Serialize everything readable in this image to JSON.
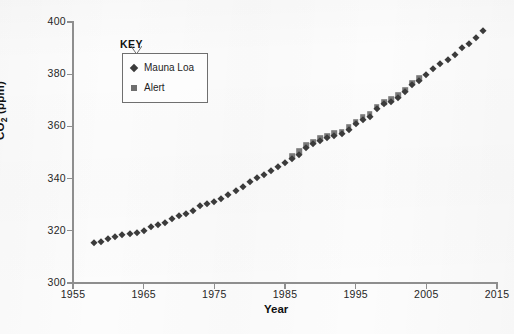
{
  "chart_data": {
    "type": "scatter",
    "title": "",
    "xlabel": "Year",
    "ylabel": "CO₂ (ppm)",
    "xlim": [
      1955,
      2015
    ],
    "ylim": [
      300,
      400
    ],
    "xticks": [
      1955,
      1965,
      1975,
      1985,
      1995,
      2005,
      2015
    ],
    "xtick_labels": [
      "1955",
      "1965",
      "1975",
      "1985",
      "1995",
      "2005",
      "2015"
    ],
    "yticks": [
      300,
      320,
      340,
      360,
      380,
      400
    ],
    "ytick_labels": [
      "300",
      "320",
      "340",
      "360",
      "380",
      "400"
    ],
    "grid": false,
    "legend_position": "upper-left-inner",
    "legend_title": "KEY",
    "series": [
      {
        "name": "Mauna Loa",
        "marker": "diamond",
        "color": "#3b3b3b",
        "x": [
          1958,
          1959,
          1960,
          1961,
          1962,
          1963,
          1964,
          1965,
          1966,
          1967,
          1968,
          1969,
          1970,
          1971,
          1972,
          1973,
          1974,
          1975,
          1976,
          1977,
          1978,
          1979,
          1980,
          1981,
          1982,
          1983,
          1984,
          1985,
          1986,
          1987,
          1988,
          1989,
          1990,
          1991,
          1992,
          1993,
          1994,
          1995,
          1996,
          1997,
          1998,
          1999,
          2000,
          2001,
          2002,
          2003,
          2004,
          2005,
          2006,
          2007,
          2008,
          2009,
          2010,
          2011,
          2012,
          2013
        ],
        "y": [
          315.3,
          315.9,
          316.9,
          317.6,
          318.4,
          318.9,
          319.3,
          320.0,
          321.3,
          322.1,
          323.0,
          324.6,
          325.6,
          326.3,
          327.4,
          329.6,
          330.2,
          331.1,
          332.0,
          333.8,
          335.4,
          336.8,
          338.7,
          340.1,
          341.4,
          343.0,
          344.6,
          346.0,
          347.4,
          349.2,
          351.6,
          353.1,
          354.4,
          355.6,
          356.4,
          357.1,
          358.8,
          360.8,
          362.6,
          363.7,
          366.7,
          368.4,
          369.5,
          371.0,
          373.2,
          375.8,
          377.5,
          379.8,
          381.9,
          383.8,
          385.6,
          387.4,
          389.9,
          391.6,
          393.8,
          396.5
        ]
      },
      {
        "name": "Alert",
        "marker": "square",
        "color": "#7a7a7a",
        "x": [
          1986,
          1987,
          1988,
          1989,
          1990,
          1991,
          1992,
          1993,
          1994,
          1995,
          1996,
          1997,
          1998,
          1999,
          2000,
          2001,
          2002,
          2003,
          2004
        ],
        "y": [
          348.6,
          350.4,
          352.8,
          354.1,
          355.4,
          356.5,
          357.3,
          358.0,
          359.7,
          361.7,
          363.5,
          364.6,
          367.6,
          369.3,
          370.4,
          371.9,
          374.1,
          376.7,
          378.4
        ]
      }
    ]
  },
  "legend": {
    "title": "KEY",
    "entries": [
      {
        "label": "Mauna Loa",
        "marker": "diamond"
      },
      {
        "label": "Alert",
        "marker": "square"
      }
    ]
  },
  "axes": {
    "x_title": "Year",
    "y_title_main": "CO",
    "y_title_sub": "2",
    "y_title_unit": " (ppm)"
  }
}
